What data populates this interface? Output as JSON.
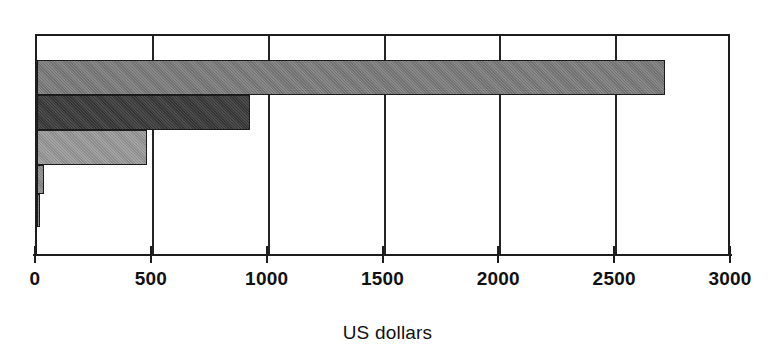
{
  "chart_data": {
    "type": "bar",
    "orientation": "horizontal",
    "title": "",
    "subtitle": "",
    "xlabel": "US dollars",
    "ylabel": "",
    "xlim": [
      0,
      3000
    ],
    "xticks": [
      0,
      500,
      1000,
      1500,
      2000,
      2500,
      3000
    ],
    "xtick_labels": [
      "0",
      "500",
      "1000",
      "1500",
      "2000",
      "2500",
      "3000"
    ],
    "ytick_labels": [],
    "grid": true,
    "grid_axis": "x",
    "legend": false,
    "legend_position": "none",
    "categories": [
      "bar-1",
      "bar-2",
      "bar-3",
      "bar-4",
      "bar-5"
    ],
    "values": [
      2710,
      918,
      474,
      30,
      8
    ],
    "bar_colors": [
      "#7d7d7d",
      "#3a3a3a",
      "#9b9b9b",
      "#8d8d8d",
      "#8d8d8d"
    ],
    "bars": [
      {
        "name": "bar-1",
        "value": 2710,
        "color": "#7d7d7d",
        "top": 58,
        "height": 35
      },
      {
        "name": "bar-2",
        "value": 918,
        "color": "#3a3a3a",
        "top": 93,
        "height": 35
      },
      {
        "name": "bar-3",
        "value": 474,
        "color": "#9b9b9b",
        "top": 128,
        "height": 35
      },
      {
        "name": "bar-4",
        "value": 30,
        "color": "#8d8d8d",
        "top": 163,
        "height": 29
      },
      {
        "name": "bar-5",
        "value": 8,
        "color": "#8d8d8d",
        "top": 192,
        "height": 33
      }
    ]
  },
  "axis": {
    "x_title": "US dollars",
    "ticks": [
      {
        "value": 0,
        "label": "0"
      },
      {
        "value": 500,
        "label": "500"
      },
      {
        "value": 1000,
        "label": "1000"
      },
      {
        "value": 1500,
        "label": "1500"
      },
      {
        "value": 2000,
        "label": "2000"
      },
      {
        "value": 2500,
        "label": "2500"
      },
      {
        "value": 3000,
        "label": "3000"
      }
    ]
  },
  "style": {
    "background": "#ffffff",
    "axis_color": "#1d1d1d",
    "text_color": "#111111"
  }
}
